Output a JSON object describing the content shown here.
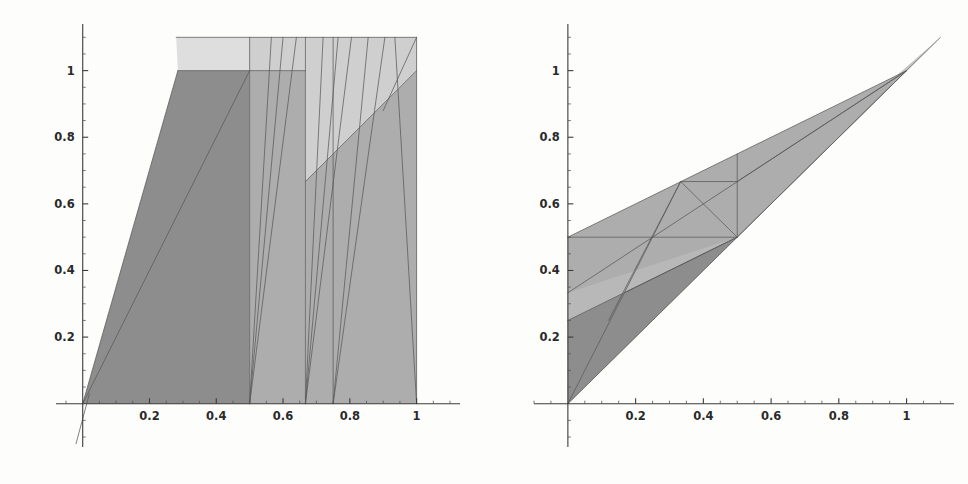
{
  "figure": {
    "title": "",
    "width": 968,
    "height": 484,
    "background": "#fdfdfc",
    "panel_count": 2
  },
  "palette": {
    "ink": "#3b3b3b",
    "edge": "#5a5a5a",
    "shade_dark": "#8d8d8d",
    "shade_mid": "#adadad",
    "shade_light": "#cfcfcf",
    "shade_lightest": "#dedede",
    "background": "#fdfdfc"
  },
  "chart_data": [
    {
      "id": "left-plot",
      "type": "scatter",
      "title": "",
      "xlabel": "",
      "ylabel": "",
      "xlim": [
        -0.08,
        1.13
      ],
      "ylim": [
        -0.13,
        1.14
      ],
      "grid": false,
      "legend": null,
      "axis_style": "mathematica-frameless-cross",
      "xticks": [
        0.2,
        0.4,
        0.6,
        0.8,
        1
      ],
      "xtick_labels": [
        "0.2",
        "0.4",
        "0.6",
        "0.8",
        "1"
      ],
      "xtick_minor_step": 0.05,
      "yticks": [
        0.2,
        0.4,
        0.6,
        0.8,
        1
      ],
      "ytick_labels": [
        "0.2",
        "0.4",
        "0.6",
        "0.8",
        "1"
      ],
      "ytick_minor_step": 0.05,
      "regions": [
        {
          "name": "upper-band-lightest",
          "shade": "#dedede",
          "points": [
            [
              0.28,
              1.1
            ],
            [
              1.0,
              1.1
            ],
            [
              1.0,
              1.0
            ],
            [
              0.285,
              1.0
            ]
          ]
        },
        {
          "name": "left-dark-wedge",
          "shade": "#8d8d8d",
          "points": [
            [
              0.0,
              0.0
            ],
            [
              0.285,
              1.0
            ],
            [
              0.5,
              1.0
            ],
            [
              0.5,
              0.0
            ]
          ]
        },
        {
          "name": "mid-column-mid",
          "shade": "#adadad",
          "points": [
            [
              0.5,
              0.0
            ],
            [
              0.5,
              1.0
            ],
            [
              0.667,
              1.0
            ],
            [
              0.667,
              0.0
            ]
          ]
        },
        {
          "name": "right-column-mid",
          "shade": "#adadad",
          "points": [
            [
              0.667,
              0.0
            ],
            [
              0.667,
              0.667
            ],
            [
              1.0,
              1.0
            ],
            [
              1.0,
              0.0
            ]
          ]
        },
        {
          "name": "upper-right-light-triangle",
          "shade": "#cfcfcf",
          "points": [
            [
              0.667,
              0.667
            ],
            [
              0.667,
              1.1
            ],
            [
              1.0,
              1.1
            ],
            [
              1.0,
              1.0
            ]
          ]
        },
        {
          "name": "top-sliver-left",
          "shade": "#cfcfcf",
          "points": [
            [
              0.5,
              1.0
            ],
            [
              0.5,
              1.1
            ],
            [
              0.667,
              1.1
            ],
            [
              0.667,
              1.0
            ]
          ]
        }
      ],
      "segments": [
        {
          "name": "diag-origin-to-top",
          "from": [
            0.0,
            0.0
          ],
          "to": [
            0.285,
            1.0
          ]
        },
        {
          "name": "diag-origin-long",
          "from": [
            0.0,
            0.0
          ],
          "to": [
            0.5,
            1.0
          ]
        },
        {
          "name": "vert-half",
          "from": [
            0.5,
            0.0
          ],
          "to": [
            0.5,
            1.1
          ]
        },
        {
          "name": "vert-two-thirds",
          "from": [
            0.667,
            0.0
          ],
          "to": [
            0.667,
            1.1
          ]
        },
        {
          "name": "vert-three-quarters",
          "from": [
            0.75,
            0.0
          ],
          "to": [
            0.75,
            1.1
          ]
        },
        {
          "name": "vert-one",
          "from": [
            1.0,
            0.0
          ],
          "to": [
            1.0,
            1.1
          ]
        },
        {
          "name": "fan-a",
          "from": [
            0.5,
            0.0
          ],
          "to": [
            0.565,
            1.1
          ]
        },
        {
          "name": "fan-b",
          "from": [
            0.5,
            0.0
          ],
          "to": [
            0.6,
            1.1
          ]
        },
        {
          "name": "fan-c",
          "from": [
            0.5,
            0.0
          ],
          "to": [
            0.64,
            1.1
          ]
        },
        {
          "name": "fan-d",
          "from": [
            0.667,
            0.0
          ],
          "to": [
            0.72,
            1.1
          ]
        },
        {
          "name": "fan-e",
          "from": [
            0.667,
            0.0
          ],
          "to": [
            0.765,
            1.1
          ]
        },
        {
          "name": "fan-f",
          "from": [
            0.667,
            0.0
          ],
          "to": [
            0.805,
            1.1
          ]
        },
        {
          "name": "fan-g",
          "from": [
            0.75,
            0.0
          ],
          "to": [
            0.855,
            1.1
          ]
        },
        {
          "name": "fan-h",
          "from": [
            0.75,
            0.0
          ],
          "to": [
            0.905,
            1.1
          ]
        },
        {
          "name": "ridge-to-corner",
          "from": [
            0.667,
            0.667
          ],
          "to": [
            1.0,
            1.0
          ]
        },
        {
          "name": "corner-down",
          "from": [
            0.935,
            1.1
          ],
          "to": [
            1.0,
            0.0
          ]
        },
        {
          "name": "corner-down-2",
          "from": [
            0.9,
            0.88
          ],
          "to": [
            1.0,
            1.1
          ]
        },
        {
          "name": "top-edge",
          "from": [
            0.28,
            1.1
          ],
          "to": [
            1.0,
            1.1
          ]
        },
        {
          "name": "level-one-edge",
          "from": [
            0.285,
            1.0
          ],
          "to": [
            0.667,
            1.0
          ]
        },
        {
          "name": "axis-overrun",
          "from": [
            -0.02,
            -0.12
          ],
          "to": [
            0.02,
            0.03
          ]
        }
      ]
    },
    {
      "id": "right-plot",
      "type": "scatter",
      "title": "",
      "xlabel": "",
      "ylabel": "",
      "xlim": [
        -0.1,
        1.14
      ],
      "ylim": [
        -0.13,
        1.14
      ],
      "grid": false,
      "legend": null,
      "axis_style": "mathematica-frameless-cross",
      "xticks": [
        0.2,
        0.4,
        0.6,
        0.8,
        1
      ],
      "xtick_labels": [
        "0.2",
        "0.4",
        "0.6",
        "0.8",
        "1"
      ],
      "xtick_minor_step": 0.05,
      "yticks": [
        0.2,
        0.4,
        0.6,
        0.8,
        1
      ],
      "ytick_labels": [
        "0.2",
        "0.4",
        "0.6",
        "0.8",
        "1"
      ],
      "ytick_minor_step": 0.05,
      "regions": [
        {
          "name": "main-upper-cone",
          "shade": "#adadad",
          "points": [
            [
              0.0,
              0.5
            ],
            [
              1.0,
              1.0
            ],
            [
              0.0,
              0.0
            ]
          ]
        },
        {
          "name": "lower-dark-wedge",
          "shade": "#8d8d8d",
          "points": [
            [
              0.0,
              0.0
            ],
            [
              0.0,
              0.25
            ],
            [
              0.167,
              0.333
            ],
            [
              0.5,
              0.5
            ]
          ]
        },
        {
          "name": "band-mid",
          "shade": "#b8b8b8",
          "points": [
            [
              0.0,
              0.333
            ],
            [
              0.5,
              0.5
            ],
            [
              0.0,
              0.25
            ]
          ]
        },
        {
          "name": "apex-sliver",
          "shade": "#c4c4c4",
          "points": [
            [
              1.0,
              1.0
            ],
            [
              1.1,
              1.1
            ],
            [
              0.97,
              0.985
            ]
          ]
        }
      ],
      "segments": [
        {
          "name": "diagonal-main",
          "from": [
            0.0,
            0.0
          ],
          "to": [
            1.1,
            1.1
          ]
        },
        {
          "name": "upper-ray",
          "from": [
            0.0,
            0.5
          ],
          "to": [
            1.0,
            1.0
          ]
        },
        {
          "name": "mid-ray-third",
          "from": [
            0.0,
            0.333
          ],
          "to": [
            1.0,
            1.0
          ]
        },
        {
          "name": "low-ray-quarter",
          "from": [
            0.0,
            0.25
          ],
          "to": [
            0.5,
            0.5
          ]
        },
        {
          "name": "horizontal-half",
          "from": [
            0.0,
            0.5
          ],
          "to": [
            0.5,
            0.5
          ]
        },
        {
          "name": "vert-half-up",
          "from": [
            0.5,
            0.5
          ],
          "to": [
            0.5,
            0.75
          ]
        },
        {
          "name": "cross-up-left",
          "from": [
            0.25,
            0.5
          ],
          "to": [
            0.333,
            0.667
          ]
        },
        {
          "name": "cross-peak-right",
          "from": [
            0.333,
            0.667
          ],
          "to": [
            0.5,
            0.5
          ]
        },
        {
          "name": "cross-peak-to-vert",
          "from": [
            0.333,
            0.667
          ],
          "to": [
            0.5,
            0.667
          ]
        },
        {
          "name": "fan-down",
          "from": [
            0.333,
            0.667
          ],
          "to": [
            0.12,
            0.25
          ]
        },
        {
          "name": "fan-down-2",
          "from": [
            0.25,
            0.5
          ],
          "to": [
            0.0,
            0.0
          ]
        },
        {
          "name": "ray-to-apex-a",
          "from": [
            0.5,
            0.667
          ],
          "to": [
            1.0,
            1.0
          ]
        },
        {
          "name": "ray-to-apex-b",
          "from": [
            0.5,
            0.5
          ],
          "to": [
            1.0,
            1.0
          ]
        },
        {
          "name": "low-edge-to-half",
          "from": [
            0.167,
            0.333
          ],
          "to": [
            0.5,
            0.5
          ]
        }
      ]
    }
  ]
}
